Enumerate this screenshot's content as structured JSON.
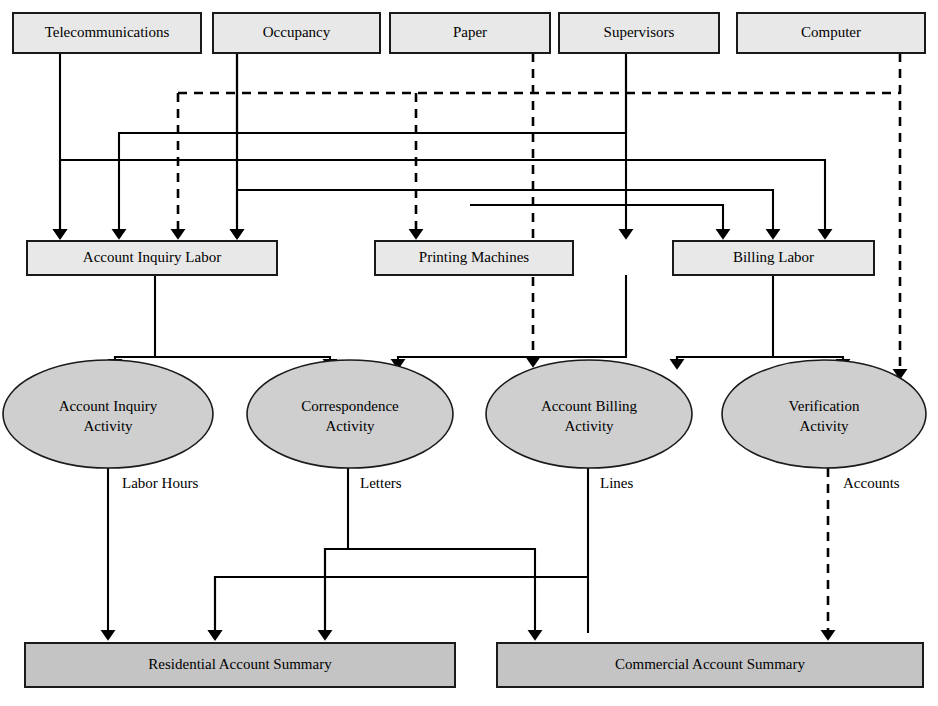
{
  "diagram": {
    "resources": [
      {
        "id": "telecommunications",
        "label": "Telecommunications",
        "x": 13,
        "y": 13,
        "w": 188,
        "h": 40
      },
      {
        "id": "occupancy",
        "label": "Occupancy",
        "x": 213,
        "y": 13,
        "w": 167,
        "h": 40
      },
      {
        "id": "paper",
        "label": "Paper",
        "x": 390,
        "y": 13,
        "w": 160,
        "h": 40
      },
      {
        "id": "supervisors",
        "label": "Supervisors",
        "x": 559,
        "y": 13,
        "w": 160,
        "h": 40
      },
      {
        "id": "computer",
        "label": "Computer",
        "x": 737,
        "y": 13,
        "w": 188,
        "h": 40
      }
    ],
    "cost_pools": [
      {
        "id": "account-inquiry-labor",
        "label": "Account Inquiry Labor",
        "x": 27,
        "y": 241,
        "w": 250,
        "h": 34
      },
      {
        "id": "printing-machines",
        "label": "Printing Machines",
        "x": 375,
        "y": 241,
        "w": 198,
        "h": 34
      },
      {
        "id": "billing-labor",
        "label": "Billing Labor",
        "x": 673,
        "y": 241,
        "w": 201,
        "h": 34
      }
    ],
    "activities": [
      {
        "id": "account-inquiry-activity",
        "line1": "Account Inquiry",
        "line2": "Activity",
        "cx": 108,
        "cy": 414,
        "rx": 105,
        "ry": 54
      },
      {
        "id": "correspondence-activity",
        "line1": "Correspondence",
        "line2": "Activity",
        "cx": 350,
        "cy": 414,
        "rx": 103,
        "ry": 54
      },
      {
        "id": "account-billing-activity",
        "line1": "Account Billing",
        "line2": "Activity",
        "cx": 589,
        "cy": 414,
        "rx": 103,
        "ry": 54
      },
      {
        "id": "verification-activity",
        "line1": "Verification",
        "line2": "Activity",
        "cx": 824,
        "cy": 414,
        "rx": 102,
        "ry": 54
      }
    ],
    "cost_objects": [
      {
        "id": "residential-account-summary",
        "label": "Residential Account Summary",
        "x": 25,
        "y": 643,
        "w": 430,
        "h": 44
      },
      {
        "id": "commercial-account-summary",
        "label": "Commercial Account Summary",
        "x": 497,
        "y": 643,
        "w": 426,
        "h": 44
      }
    ],
    "driver_labels": [
      {
        "id": "labor-hours",
        "text": "Labor Hours",
        "x": 122,
        "y": 488
      },
      {
        "id": "letters",
        "text": "Letters",
        "x": 360,
        "y": 488
      },
      {
        "id": "lines",
        "text": "Lines",
        "x": 600,
        "y": 488
      },
      {
        "id": "accounts",
        "text": "Accounts",
        "x": 843,
        "y": 488
      }
    ],
    "colors": {
      "resource_fill": "#e8e8e8",
      "activity_fill": "#cfcfcf",
      "cost_object_fill": "#c4c4c4",
      "stroke": "#1a1a1a",
      "edge": "#000000"
    },
    "edges": [
      {
        "id": "telecom-to-account-inquiry-labor",
        "style": "solid",
        "from": "telecommunications",
        "to": "account-inquiry-labor",
        "d": "M 60 53 L 60 232"
      },
      {
        "id": "occupancy-to-account-inquiry-labor-left",
        "style": "solid",
        "from": "occupancy",
        "to": "account-inquiry-labor",
        "d": "M 237 53 L 237 133 L 119 133 L 119 232"
      },
      {
        "id": "occupancy-to-account-inquiry-labor-direct",
        "style": "solid",
        "from": "occupancy",
        "to": "account-inquiry-labor",
        "d": "M 237 53 L 237 232"
      },
      {
        "id": "occupancy-dashed-trunk",
        "style": "dashed",
        "from": "occupancy",
        "to": "account-inquiry-labor",
        "d": "M 178 93 L 178 232"
      },
      {
        "id": "occupancy-dashed-horizontal",
        "style": "dashed",
        "from": "occupancy",
        "to": "computer",
        "d": "M 178 93 L 900 93"
      },
      {
        "id": "paper-to-printing-machines",
        "style": "dashed",
        "from": "paper",
        "to": "printing-machines",
        "d": "M 416 93 L 416 232"
      },
      {
        "id": "paper-dashed-to-account-billing",
        "style": "dashed",
        "from": "paper",
        "to": "account-billing-activity",
        "d": "M 533 53 L 533 360"
      },
      {
        "id": "supervisors-to-printing-machines",
        "style": "solid",
        "from": "supervisors",
        "to": "printing-machines",
        "d": "M 626 53 L 626 232"
      },
      {
        "id": "supervisors-to-account-inquiry-labor",
        "style": "solid",
        "from": "supervisors",
        "to": "account-inquiry-labor",
        "d": "M 626 53 L 626 133 L 119 133"
      },
      {
        "id": "supervisors-to-billing-labor",
        "style": "solid",
        "from": "supervisors",
        "to": "billing-labor",
        "d": "M 626 160 L 825 160 L 825 232"
      },
      {
        "id": "horizontal-bus-160",
        "style": "solid",
        "from": "account-inquiry-labor",
        "to": "billing-labor",
        "d": "M 60 160 L 825 160"
      },
      {
        "id": "horizontal-bus-190",
        "style": "solid",
        "from": "account-inquiry-labor",
        "to": "billing-labor",
        "d": "M 237 190 L 773 190 L 773 232"
      },
      {
        "id": "bus-190-to-printing",
        "style": "solid",
        "from": "printing-machines",
        "to": "billing-labor",
        "d": "M 470 205 L 723 205 L 723 232"
      },
      {
        "id": "computer-dashed-down",
        "style": "dashed",
        "from": "computer",
        "to": "verification-activity",
        "d": "M 900 53 L 900 372"
      },
      {
        "id": "account-inquiry-labor-fanout",
        "style": "solid",
        "from": "account-inquiry-labor",
        "to": "correspondence-activity",
        "d": "M 155 275 L 155 357 L 115 357 L 115 362 M 155 357 L 330 357 L 330 362"
      },
      {
        "id": "printing-machines-fanout",
        "style": "solid",
        "from": "printing-machines",
        "to": "correspondence-activity",
        "d": "M 626 275 L 626 357 L 398 357 L 398 362"
      },
      {
        "id": "billing-labor-fanout",
        "style": "solid",
        "from": "billing-labor",
        "to": "verification-activity",
        "d": "M 773 275 L 773 357 L 677 357 L 677 362 M 773 357 L 843 357 L 843 362"
      },
      {
        "id": "labor-hours-to-residential",
        "style": "solid",
        "from": "account-inquiry-activity",
        "to": "residential-account-summary",
        "d": "M 108 468 L 108 633"
      },
      {
        "id": "letters-split",
        "style": "solid",
        "from": "correspondence-activity",
        "to": "residential-account-summary",
        "d": "M 348 468 L 348 549 L 325 549 L 325 633 M 348 549 L 535 549 L 535 633"
      },
      {
        "id": "lines-split",
        "style": "solid",
        "from": "account-billing-activity",
        "to": "residential-account-summary",
        "d": "M 588 468 L 588 633 M 588 577 L 215 577 L 215 633"
      },
      {
        "id": "accounts-to-commercial",
        "style": "dashed",
        "from": "verification-activity",
        "to": "commercial-account-summary",
        "d": "M 828 468 L 828 633"
      }
    ]
  }
}
